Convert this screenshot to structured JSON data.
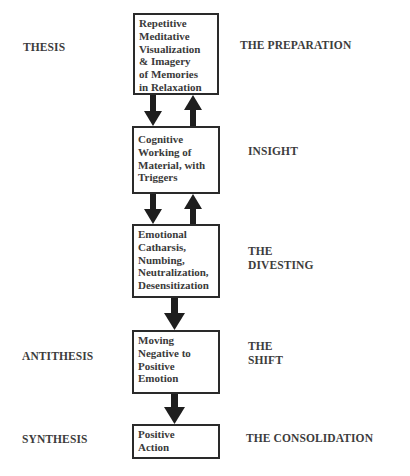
{
  "left_labels": {
    "thesis": "THESIS",
    "antithesis": "ANTITHESIS",
    "synthesis": "SYNTHESIS"
  },
  "right_labels": {
    "preparation": "THE PREPARATION",
    "insight": "INSIGHT",
    "divesting": "THE\nDIVESTING",
    "shift": "THE\nSHIFT",
    "consolidation": "THE CONSOLIDATION"
  },
  "boxes": [
    {
      "text": "Repetitive\nMeditative\nVisualization\n& Imagery\nof Memories\nin Relaxation"
    },
    {
      "text": "Cognitive\nWorking of\nMaterial, with\nTriggers"
    },
    {
      "text": "Emotional\nCatharsis,\nNumbing,\nNeutralization,\nDesensitization"
    },
    {
      "text": "Moving\nNegative to\nPositive\nEmotion"
    },
    {
      "text": "Positive\nAction"
    }
  ],
  "arrows": [
    {
      "from": 1,
      "to": 2,
      "direction": "down"
    },
    {
      "from": 2,
      "to": 1,
      "direction": "up"
    },
    {
      "from": 2,
      "to": 3,
      "direction": "down"
    },
    {
      "from": 3,
      "to": 2,
      "direction": "up"
    },
    {
      "from": 3,
      "to": 4,
      "direction": "down"
    },
    {
      "from": 4,
      "to": 5,
      "direction": "down"
    }
  ]
}
